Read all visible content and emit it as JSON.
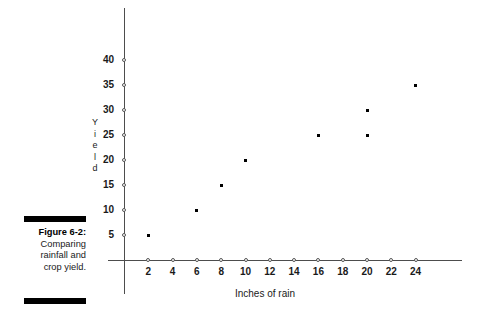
{
  "caption": {
    "figure_number": "Figure 6-2:",
    "lines": [
      "Comparing",
      "rainfall and",
      "crop yield."
    ]
  },
  "chart_data": {
    "type": "scatter",
    "title": "",
    "xlabel": "Inches of rain",
    "ylabel": "Yield",
    "ylabel_chars": [
      "Y",
      "i",
      "e",
      "l",
      "d"
    ],
    "xlim": [
      0,
      26
    ],
    "ylim": [
      0,
      42
    ],
    "grid": false,
    "legend": null,
    "xticks": [
      2,
      4,
      6,
      8,
      10,
      12,
      14,
      16,
      18,
      20,
      22,
      24
    ],
    "xtick_labels": [
      "2",
      "4",
      "6",
      "8",
      "10",
      "12",
      "14",
      "16",
      "18",
      "20",
      "22",
      "24"
    ],
    "yticks": [
      5,
      10,
      15,
      20,
      25,
      30,
      35,
      40
    ],
    "ytick_labels": [
      "5",
      "10",
      "15",
      "20",
      "25",
      "30",
      "35",
      "40"
    ],
    "tick_marker_style": "open-circle",
    "point_marker_style": "filled-square",
    "point_color": "#000000",
    "axis_color": "#4d4d4d",
    "points": [
      {
        "x": 2,
        "y": 5
      },
      {
        "x": 6,
        "y": 10
      },
      {
        "x": 8,
        "y": 15
      },
      {
        "x": 10,
        "y": 20
      },
      {
        "x": 16,
        "y": 25
      },
      {
        "x": 20,
        "y": 25
      },
      {
        "x": 20,
        "y": 30
      },
      {
        "x": 24,
        "y": 35
      }
    ]
  }
}
